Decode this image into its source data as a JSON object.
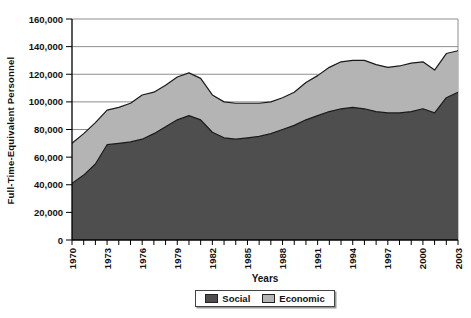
{
  "chart_data": {
    "type": "area",
    "stacked": true,
    "title": "",
    "xlabel": "Years",
    "ylabel": "Full-Time-Equivalent Personnel",
    "x": [
      1970,
      1971,
      1972,
      1973,
      1974,
      1975,
      1976,
      1977,
      1978,
      1979,
      1980,
      1981,
      1982,
      1983,
      1984,
      1985,
      1986,
      1987,
      1988,
      1989,
      1990,
      1991,
      1992,
      1993,
      1994,
      1995,
      1996,
      1997,
      1998,
      1999,
      2000,
      2001,
      2002,
      2003
    ],
    "series": [
      {
        "name": "Social",
        "color": "#4e4e4e",
        "values": [
          41000,
          47000,
          55000,
          69000,
          70000,
          71000,
          73000,
          77000,
          82000,
          87000,
          90000,
          87000,
          78000,
          74000,
          73000,
          74000,
          75000,
          77000,
          80000,
          83000,
          87000,
          90000,
          93000,
          95000,
          96000,
          95000,
          93000,
          92000,
          92000,
          93000,
          95000,
          92000,
          103000,
          107000
        ]
      },
      {
        "name": "Economic",
        "color": "#b4b4b4",
        "values": [
          29000,
          30000,
          30000,
          25000,
          26000,
          28000,
          32000,
          30000,
          30000,
          31000,
          31000,
          30000,
          27000,
          26000,
          26000,
          25000,
          24000,
          23000,
          23000,
          24000,
          27000,
          29000,
          32000,
          34000,
          34000,
          35000,
          34000,
          33000,
          34000,
          35000,
          34000,
          31000,
          32000,
          30000
        ]
      }
    ],
    "ylim": [
      0,
      160000
    ],
    "ytick_step": 20000,
    "xtick_label_step": 3,
    "grid": "horizontal",
    "legend_position": "bottom",
    "colors": {
      "grid": "#8e8e8e",
      "axis": "#000000",
      "line": "#1a1a1a"
    }
  }
}
